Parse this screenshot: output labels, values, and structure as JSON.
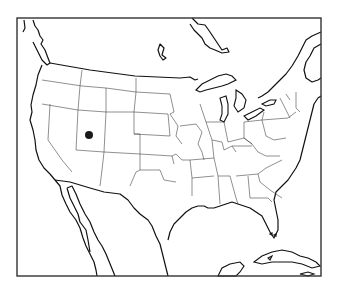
{
  "map": {
    "type": "locator-map",
    "region": "United States (contiguous) with southern Canada, northern Mexico and Caribbean",
    "projection": "conic",
    "background_color": "#ffffff",
    "line_color": "#111111",
    "frame": {
      "x": 17,
      "y": 18,
      "width": 304,
      "height": 258
    },
    "marker": {
      "name": "location-marker",
      "shape": "circle",
      "color": "#1a1a1a",
      "cx": 89,
      "cy": 135,
      "r": 4,
      "approx_location": "northern Utah"
    },
    "visible_features": [
      "US state borders",
      "Canada coastline",
      "Great Lakes",
      "Gulf of Mexico coast",
      "Baja California",
      "Florida",
      "Cuba",
      "Bahamas"
    ]
  }
}
